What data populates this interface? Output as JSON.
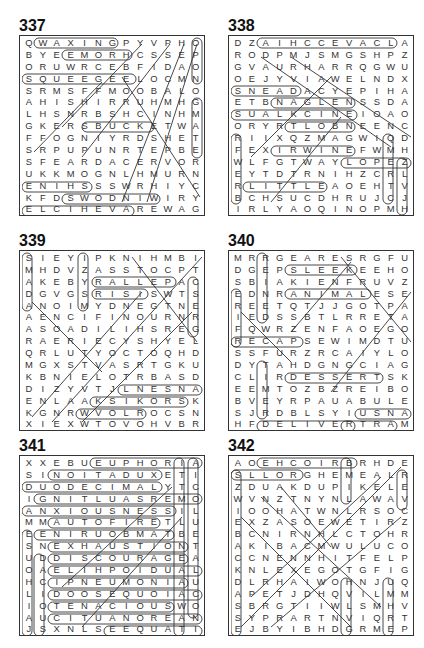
{
  "page": {
    "puzzles": [
      {
        "number": "337",
        "rows": [
          "QWAXINGPYVPHOSS",
          "BYEEMORHCSSEPIH",
          "ORUWRCEBFIDAOHE",
          "SQUEEGEELOCMNSL",
          "SRMSFFMOOBALOIG",
          "AHISHIRRUHMHGVN",
          "LHSNRBSHCINHMAI",
          "GKERSBUCKETWAHB",
          "FFOGNIYRDSHETIB",
          "SRPUPUNRTEPBECU",
          "SFEARDACERVORLR",
          "UKKMOGNLHMURNEC",
          "ENIHSSSWRHIYCGS",
          "KFDSWODNIWIRYFE",
          "ELCIHEVAREWAGER"
        ],
        "circled_words": [
          "WAXING",
          "EMORHC",
          "SQUEEGEE",
          "BUCKET",
          "ENIHS",
          "SWODNIW",
          "ELCIHEV",
          "SCRUBS",
          "GLASS",
          "WAGER"
        ]
      },
      {
        "number": "338",
        "rows": [
          "DZAIHCCEVACLACS",
          "RODPMJSMGSHPZTC",
          "GVAURHARRQGWUFE",
          "OEJYVIAWELNDXHV",
          "SNEADACYEPIHAQW",
          "ETBNAGLENSSDALP",
          "SUALKCINEIOAOSY",
          "ORYRTLOBNEENCVD",
          "RIIXQZMAGWIQDSJ",
          "FEXIRWINEFWMHEE",
          "WLFGTWAYLOPEZNL",
          "EYTDTRNIHZCRLRO",
          "RLITTLEAOEHTVAC",
          "BCHSUCDHRUJCJBK",
          "IRLYAOQINOPMHXE"
        ],
        "circled_words": [
          "AIHCCEVACLAC",
          "SNEAD",
          "NAGLE",
          "SUALKCIN",
          "TLOB",
          "IRWIN",
          "LOPEZ",
          "LITTLE",
          "SNRAB",
          "LOCKE",
          "WEBER"
        ]
      },
      {
        "number": "339",
        "rows": [
          "SIEYIPKNIHMBITT",
          "MHDVZASSTOCPTAH",
          "AKEBYRALLEPACFB",
          "DGVGSRISISWTSSY",
          "ANOIMYDNEGTNEOR",
          "AENCIFINOURNRXD",
          "ASOADILIHSREGIEG",
          "RAERIECYSHYELCG",
          "QRLUTYOCTOQHDAL",
          "MGXSTVASRTGKUHC",
          "KBNIELOTRBASDTQ",
          "DIZYVTJLNESNANK",
          "ENLAAKSIKORSKIQ",
          "KGNRWVOLROCSNRQ",
          "XIEXWTOVOHVBRXV"
        ],
        "circled_words": [
          "ALLEPAC",
          "ISIS",
          "SIKORSKI",
          "VOLROC",
          "NESNAN",
          "SMADA",
          "PARIS",
          "BYRD"
        ]
      },
      {
        "number": "340",
        "rows": [
          "MRRGEARESRGFURE",
          "DGEPSLEEKEEHOEB",
          "SBIAKIENFRUVZMC",
          "EDNRANIMALESEGX",
          "REETQTJJGOTPALN",
          "IEDSSBTLRRETAIP",
          "FQWRZENFAOEGOIR",
          "RECAPSEWIMDTUCD",
          "SSFURZRCAIYLOLO",
          "DYTAHDGNGCIAGOP",
          "CLIRDESSERTSKOL",
          "EEMTOZBZREIBOKT",
          "BVEYRPAUABULETA",
          "SJRDBLSYIUSNAPS",
          "HFDELIVERTRAMSU"
        ],
        "circled_words": [
          "SLEEK",
          "ANIMAL",
          "RECAPS",
          "DESSERTS",
          "SNAPS",
          "DELIVER",
          "TRAMS",
          "SERIF",
          "REINS"
        ]
      },
      {
        "number": "341",
        "rows": [
          "XXEBUEUPHORIACE",
          "SINOITADUXETIOL",
          "DUODECIMALYTCNB",
          "IGNITLUASREMOSA",
          "ANXIOUSNESSILUT",
          "MMAUTOFIRETLULR",
          "EENIRUOBMATBETO",
          "SNEXHAUSTIONTAP",
          "UDDISCOURAGEATP",
          "OAELIHPOIDUALIU",
          "HCIPNEUMONIAUVS",
          "LIDOOSEQUOIACEN",
          "IOTENACIOUSWOII",
          "AUCITUANOREANVH",
          "JSXNLSEEQUATION"
        ],
        "circled_words": [
          "EUPHORIA",
          "NOITADUXE",
          "DUODECIMAL",
          "GNITLUASREMOS",
          "ANXIOUSNESS",
          "AUTOFIRE",
          "ENIRUOBMAT",
          "EXHAUSTION",
          "DISCOURAGE",
          "AELIHPOIDUA",
          "PNEUMONIA",
          "DOOSEQUOIA",
          "TENACIOUS",
          "CITUANOREA",
          "EQUATION"
        ]
      },
      {
        "number": "342",
        "rows": [
          "AOEHCOIRBRHDETT",
          "SLLORGHEMEALRYN",
          "ZDUAKDUPIKELEEN",
          "WVNZTNYNLAWAVEI",
          "IOOHATWNLRSOCAA",
          "EXZASOEWETIRZAR",
          "BCNIRNHLCTOHRUG",
          "AKIBACMWULUCOPE",
          "CCNENNHITFELPGL",
          "KNLEXEGOTGFIGDO",
          "DLRHAIWOHNJUQRH",
          "APETJDHQVILMMAW",
          "SBRGTIIWLSMHVOK",
          "SYPRARTNVIQRTBU",
          "EJBYIBHDGRMEPNY"
        ],
        "circled_words": [
          "EHCOIRB",
          "SLLOR"
        ]
      }
    ]
  }
}
